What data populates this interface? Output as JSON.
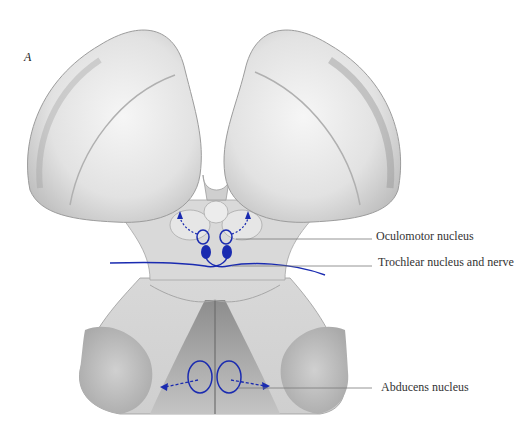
{
  "figure": {
    "panel_letter": "A",
    "highlight_color": "#1a2bb0",
    "labels": {
      "oculomotor": "Oculomotor nucleus",
      "trochlear": "Trochlear nucleus and nerve",
      "abducens": "Abducens nucleus"
    }
  }
}
